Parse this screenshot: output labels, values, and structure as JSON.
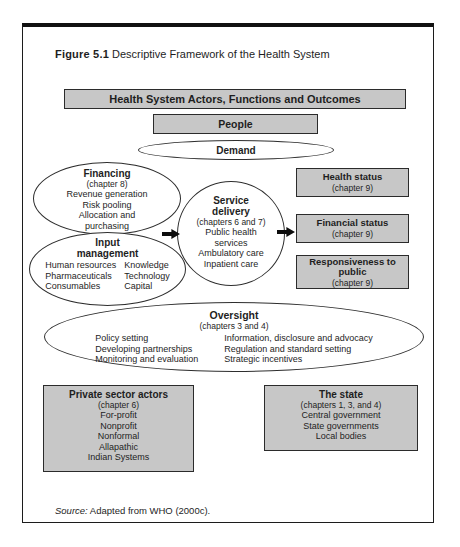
{
  "figure": {
    "label": "Figure 5.1",
    "title": " Descriptive Framework of the Health System"
  },
  "colors": {
    "box_fill": "#c7c7c7",
    "border": "#2b2b2b",
    "arrow": "#0d0d0d",
    "background": "#ffffff"
  },
  "banner": {
    "label": "Health System Actors, Functions and Outcomes"
  },
  "people": {
    "label": "People"
  },
  "demand": {
    "label": "Demand"
  },
  "financing": {
    "title": "Financing",
    "subtitle": "(chapter 8)",
    "lines": [
      "Revenue generation",
      "Risk pooling",
      "Allocation and purchasing"
    ]
  },
  "input_management": {
    "title": "Input management",
    "col1": [
      "Human resources",
      "Pharmaceuticals",
      "Consumables"
    ],
    "col2": [
      "Knowledge",
      "Technology",
      "Capital"
    ]
  },
  "service_delivery": {
    "title": "Service delivery",
    "subtitle": "(chapters 6 and 7)",
    "lines": [
      "Public health services",
      "Ambulatory care",
      "Inpatient care"
    ]
  },
  "outcomes": [
    {
      "title": "Health status",
      "subtitle": "(chapter 9)"
    },
    {
      "title": "Financial status",
      "subtitle": "(chapter 9)"
    },
    {
      "title": "Responsiveness to public",
      "subtitle": "(chapter 9)"
    }
  ],
  "oversight": {
    "title": "Oversight",
    "subtitle": "(chapters 3 and 4)",
    "col1": [
      "Policy setting",
      "Developing partnerships",
      "Monitoring and evaluation"
    ],
    "col2": [
      "Information, disclosure and advocacy",
      "Regulation and standard setting",
      "Strategic incentives"
    ]
  },
  "private_sector": {
    "title": "Private sector actors",
    "subtitle": "(chapter 6)",
    "lines": [
      "For-profit",
      "Nonprofit",
      "Nonformal",
      "Allapathic",
      "Indian Systems"
    ]
  },
  "state": {
    "title": "The state",
    "subtitle": "(chapters 1, 3, and 4)",
    "lines": [
      "Central government",
      "State governments",
      "Local bodies"
    ]
  },
  "source": {
    "prefix": "Source:",
    "text": " Adapted from WHO (2000c)."
  }
}
